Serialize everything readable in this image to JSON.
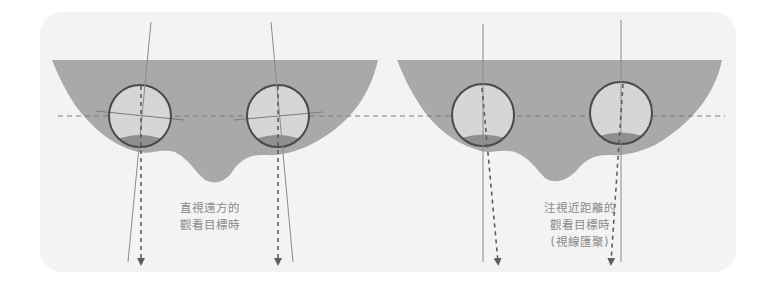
{
  "diagram": {
    "colors": {
      "panel_bg": "#f3f3f3",
      "head_fill": "#a9a9a9",
      "eye_fill": "#d6d6d6",
      "eye_lens_fill": "#8f8f8f",
      "eye_stroke": "#4a4a4a",
      "line": "#7a7a7a",
      "arrow": "#5e5e5e",
      "text": "#8a8a8a"
    },
    "panels": [
      {
        "id": "far",
        "caption_lines": [
          "直視遠方的",
          "觀看目標時"
        ],
        "gaze": "parallel"
      },
      {
        "id": "near",
        "caption_lines": [
          "注視近距離的",
          "觀看目標時",
          "(視線匯聚)"
        ],
        "gaze": "converging"
      }
    ]
  }
}
